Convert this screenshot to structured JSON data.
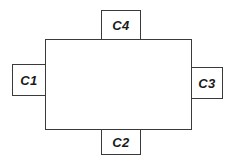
{
  "diagram": {
    "main_block": {
      "label": ""
    },
    "components": [
      {
        "id": "c1",
        "label": "C1",
        "position": "left"
      },
      {
        "id": "c2",
        "label": "C2",
        "position": "bottom"
      },
      {
        "id": "c3",
        "label": "C3",
        "position": "right"
      },
      {
        "id": "c4",
        "label": "C4",
        "position": "top"
      }
    ]
  }
}
